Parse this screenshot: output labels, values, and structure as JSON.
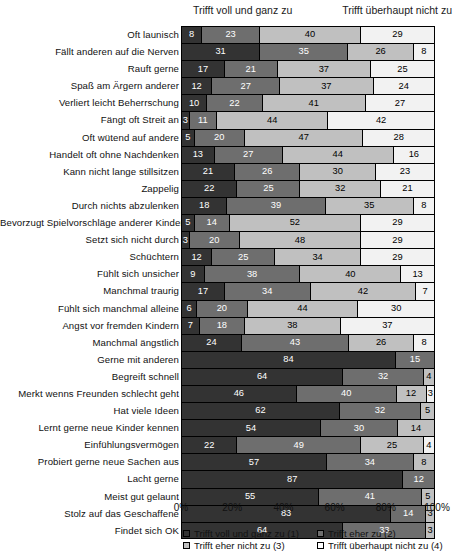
{
  "header": {
    "left_annotation": "Trifft voll und ganz zu",
    "right_annotation": "Trifft überhaupt nicht zu"
  },
  "legend": {
    "items": [
      {
        "label": "Trifft voll und ganz zu (1)",
        "color": "#333333"
      },
      {
        "label": "Trifft eher zu (2)",
        "color": "#6e6e6e"
      },
      {
        "label": "Trifft eher nicht zu (3)",
        "color": "#c0c0c0"
      },
      {
        "label": "Trifft überhaupt nicht zu (4)",
        "color": "#ffffff"
      }
    ]
  },
  "axis": {
    "ticks": [
      "0%",
      "20%",
      "40%",
      "60%",
      "80%",
      "100%"
    ]
  },
  "chart_data": {
    "type": "bar",
    "orientation": "horizontal",
    "stacked": true,
    "stack_mode": "percent",
    "title": "",
    "xlabel": "",
    "ylabel": "",
    "xlim": [
      0,
      100
    ],
    "grid": false,
    "legend_position": "bottom",
    "left_axis_annotation": "Trifft voll und ganz zu",
    "right_axis_annotation": "Trifft überhaupt nicht zu",
    "series": [
      {
        "name": "Trifft voll und ganz zu (1)",
        "color": "#333333"
      },
      {
        "name": "Trifft eher zu (2)",
        "color": "#6e6e6e"
      },
      {
        "name": "Trifft eher nicht zu (3)",
        "color": "#c0c0c0"
      },
      {
        "name": "Trifft überhaupt nicht zu (4)",
        "color": "#f2f2f2"
      }
    ],
    "categories": [
      "Oft launisch",
      "Fällt anderen auf die Nerven",
      "Rauft gerne",
      "Spaß am Ärgern anderer",
      "Verliert leicht Beherrschung",
      "Fängt oft Streit an",
      "Oft wütend auf andere",
      "Handelt oft ohne Nachdenken",
      "Kann nicht lange stillsitzen",
      "Zappelig",
      "Durch nichts abzulenken",
      "Bevorzugt Spielvorschläge anderer Kinder",
      "Setzt sich nicht durch",
      "Schüchtern",
      "Fühlt sich unsicher",
      "Manchmal traurig",
      "Fühlt sich manchmal alleine",
      "Angst vor fremden Kindern",
      "Manchmal ängstlich",
      "Gerne mit anderen",
      "Begreift schnell",
      "Merkt wenns Freunden schlecht geht",
      "Hat viele Ideen",
      "Lernt gerne neue Kinder kennen",
      "Einfühlungsvermögen",
      "Probiert gerne neue Sachen aus",
      "Lacht gerne",
      "Meist gut gelaunt",
      "Stolz auf das Geschaffene",
      "Findet sich OK"
    ],
    "rows": [
      {
        "category": "Oft launisch",
        "values": [
          8,
          23,
          40,
          29
        ]
      },
      {
        "category": "Fällt anderen auf die Nerven",
        "values": [
          31,
          35,
          26,
          8
        ]
      },
      {
        "category": "Rauft gerne",
        "values": [
          17,
          21,
          37,
          25
        ]
      },
      {
        "category": "Spaß am Ärgern anderer",
        "values": [
          12,
          27,
          37,
          24
        ]
      },
      {
        "category": "Verliert leicht Beherrschung",
        "values": [
          10,
          22,
          41,
          27
        ]
      },
      {
        "category": "Fängt oft Streit an",
        "values": [
          3,
          11,
          44,
          42
        ]
      },
      {
        "category": "Oft wütend auf andere",
        "values": [
          5,
          20,
          47,
          28
        ]
      },
      {
        "category": "Handelt oft ohne Nachdenken",
        "values": [
          13,
          27,
          44,
          16
        ]
      },
      {
        "category": "Kann nicht lange stillsitzen",
        "values": [
          21,
          26,
          30,
          23
        ]
      },
      {
        "category": "Zappelig",
        "values": [
          22,
          25,
          32,
          21
        ]
      },
      {
        "category": "Durch nichts abzulenken",
        "values": [
          18,
          39,
          35,
          8
        ]
      },
      {
        "category": "Bevorzugt Spielvorschläge anderer Kinder",
        "values": [
          5,
          14,
          52,
          29
        ]
      },
      {
        "category": "Setzt sich nicht durch",
        "values": [
          3,
          20,
          48,
          29
        ]
      },
      {
        "category": "Schüchtern",
        "values": [
          12,
          25,
          34,
          29
        ]
      },
      {
        "category": "Fühlt sich unsicher",
        "values": [
          9,
          38,
          40,
          13
        ]
      },
      {
        "category": "Manchmal traurig",
        "values": [
          17,
          34,
          42,
          7
        ]
      },
      {
        "category": "Fühlt sich manchmal alleine",
        "values": [
          6,
          20,
          44,
          30
        ]
      },
      {
        "category": "Angst vor fremden Kindern",
        "values": [
          7,
          18,
          38,
          37
        ]
      },
      {
        "category": "Manchmal ängstlich",
        "values": [
          24,
          43,
          26,
          8
        ]
      },
      {
        "category": "Gerne mit anderen",
        "values": [
          84,
          15,
          0,
          0
        ]
      },
      {
        "category": "Begreift schnell",
        "values": [
          64,
          32,
          4,
          0
        ]
      },
      {
        "category": "Merkt wenns Freunden schlecht geht",
        "values": [
          46,
          40,
          12,
          3
        ]
      },
      {
        "category": "Hat viele Ideen",
        "values": [
          62,
          32,
          5,
          0
        ]
      },
      {
        "category": "Lernt gerne neue Kinder kennen",
        "values": [
          54,
          30,
          14,
          0
        ]
      },
      {
        "category": "Einfühlungsvermögen",
        "values": [
          22,
          49,
          25,
          4
        ]
      },
      {
        "category": "Probiert gerne neue Sachen aus",
        "values": [
          57,
          34,
          8,
          0
        ]
      },
      {
        "category": "Lacht gerne",
        "values": [
          87,
          12,
          0,
          0
        ]
      },
      {
        "category": "Meist gut gelaunt",
        "values": [
          55,
          41,
          5,
          0
        ]
      },
      {
        "category": "Stolz auf das Geschaffene",
        "values": [
          83,
          14,
          3,
          0
        ]
      },
      {
        "category": "Findet sich OK",
        "values": [
          64,
          33,
          3,
          0
        ]
      }
    ]
  }
}
